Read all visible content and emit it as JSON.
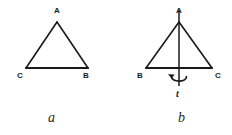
{
  "figure": {
    "background_color": "#ffffff",
    "ink_color": "#1a1a1a",
    "panels": [
      {
        "caption": "a",
        "caption_x": 48,
        "caption_y": 122,
        "shape": "isosceles-triangle",
        "apex": {
          "label": "A",
          "x": 57,
          "y": 22,
          "label_x": 54,
          "label_y": 13
        },
        "left_vertex": {
          "label": "C",
          "x": 26,
          "y": 68,
          "label_x": 17,
          "label_y": 78
        },
        "right_vertex": {
          "label": "B",
          "x": 88,
          "y": 68,
          "label_x": 83,
          "label_y": 78
        },
        "has_axis": false,
        "has_rotation_arrow": false
      },
      {
        "caption": "b",
        "caption_x": 178,
        "caption_y": 122,
        "shape": "isosceles-triangle",
        "apex": {
          "label": "A",
          "x": 179,
          "y": 22,
          "label_x": 176,
          "label_y": 13
        },
        "left_vertex": {
          "label": "B",
          "x": 146,
          "y": 68,
          "label_x": 137,
          "label_y": 78
        },
        "right_vertex": {
          "label": "C",
          "x": 212,
          "y": 68,
          "label_x": 215,
          "label_y": 78
        },
        "has_axis": true,
        "axis": {
          "label": "t",
          "label_x": 176,
          "label_y": 97,
          "top_y": 10,
          "bottom_y": 86,
          "x": 179
        },
        "has_rotation_arrow": true,
        "rotation_arrow": {
          "direction": "counterclockwise",
          "center_x": 179,
          "center_y": 79
        }
      }
    ]
  }
}
